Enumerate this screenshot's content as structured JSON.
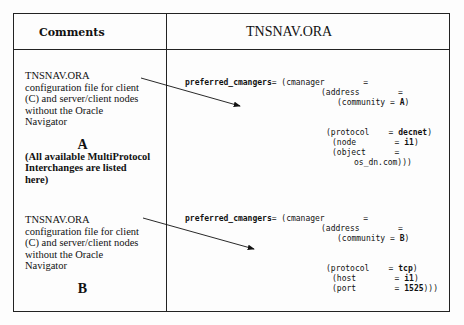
{
  "header": {
    "comments_label": "Comments",
    "file_label": "TNSNAV.ORA"
  },
  "rows": [
    {
      "comment_lines": [
        "TNSNAV.ORA",
        "configuration file for client",
        "(C) and server/client nodes",
        "without the Oracle",
        "Navigator"
      ],
      "letter": "A",
      "note_lines": [
        "(All available MultiProtocol",
        "Interchanges are listed",
        "here)"
      ],
      "code": {
        "line1_key": "preferred_cmangers",
        "line1_rest": "= (cmanager        =",
        "line2": "(address        =",
        "line3_pre": "(community = ",
        "line3_val": "A",
        "line3_post": ")",
        "protocol_key": "(protocol    = ",
        "protocol_val": "decnet",
        "protocol_post": ")",
        "p2_key": "(node        = ",
        "p2_val": "i1",
        "p2_post": ")",
        "p3_key": "(object      =",
        "p3_cont": "os_dn.com)))"
      }
    },
    {
      "comment_lines": [
        "TNSNAV.ORA",
        "configuration file for client",
        "(C) and server/client nodes",
        "without the Oracle",
        "Navigator"
      ],
      "letter": "B",
      "code": {
        "line1_key": "preferred_cmangers",
        "line1_rest": "= (cmanager        =",
        "line2": "(address        =",
        "line3_pre": "(community = ",
        "line3_val": "B",
        "line3_post": ")",
        "protocol_key": "(protocol    = ",
        "protocol_val": "tcp",
        "protocol_post": ")",
        "p2_key": "(host        = ",
        "p2_val": "i1",
        "p2_post": ")",
        "p3_key": "(port        = ",
        "p3_val": "1525",
        "p3_post": ")))"
      }
    }
  ]
}
